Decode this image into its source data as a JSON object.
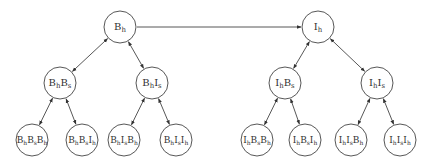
{
  "diagram": {
    "type": "tree",
    "colors": {
      "stroke": "#444444",
      "text": "#333333",
      "background": "#ffffff"
    },
    "nodes": [
      {
        "id": "Bh",
        "x": 120,
        "y": 27,
        "r": 16,
        "parts": [
          [
            "B",
            "h"
          ]
        ]
      },
      {
        "id": "Ih",
        "x": 318,
        "y": 27,
        "r": 16,
        "parts": [
          [
            "I",
            "h"
          ]
        ]
      },
      {
        "id": "BhBs",
        "x": 60,
        "y": 83,
        "r": 16,
        "parts": [
          [
            "B",
            "h"
          ],
          [
            "B",
            "s"
          ]
        ]
      },
      {
        "id": "BhIs",
        "x": 152,
        "y": 83,
        "r": 16,
        "parts": [
          [
            "B",
            "h"
          ],
          [
            "I",
            "s"
          ]
        ]
      },
      {
        "id": "IhBs",
        "x": 285,
        "y": 83,
        "r": 16,
        "parts": [
          [
            "I",
            "h"
          ],
          [
            "B",
            "s"
          ]
        ]
      },
      {
        "id": "IhIs",
        "x": 377,
        "y": 83,
        "r": 16,
        "parts": [
          [
            "I",
            "h"
          ],
          [
            "I",
            "s"
          ]
        ]
      },
      {
        "id": "BhBsBh",
        "x": 32,
        "y": 140,
        "r": 16,
        "parts": [
          [
            "B",
            "h"
          ],
          [
            "B",
            "s"
          ],
          [
            "B",
            "h"
          ]
        ]
      },
      {
        "id": "BhBsIh",
        "x": 82,
        "y": 140,
        "r": 16,
        "parts": [
          [
            "B",
            "h"
          ],
          [
            "B",
            "s"
          ],
          [
            "I",
            "h"
          ]
        ]
      },
      {
        "id": "BhIsBh",
        "x": 124,
        "y": 140,
        "r": 16,
        "parts": [
          [
            "B",
            "h"
          ],
          [
            "I",
            "s"
          ],
          [
            "B",
            "h"
          ]
        ]
      },
      {
        "id": "BhIsIh",
        "x": 176,
        "y": 140,
        "r": 16,
        "parts": [
          [
            "B",
            "h"
          ],
          [
            "I",
            "s"
          ],
          [
            "I",
            "h"
          ]
        ]
      },
      {
        "id": "IhBsBh",
        "x": 257,
        "y": 140,
        "r": 16,
        "parts": [
          [
            "I",
            "h"
          ],
          [
            "B",
            "s"
          ],
          [
            "B",
            "h"
          ]
        ]
      },
      {
        "id": "IhBsIh",
        "x": 305,
        "y": 140,
        "r": 16,
        "parts": [
          [
            "I",
            "h"
          ],
          [
            "B",
            "s"
          ],
          [
            "I",
            "h"
          ]
        ]
      },
      {
        "id": "IhIsBh",
        "x": 351,
        "y": 140,
        "r": 16,
        "parts": [
          [
            "I",
            "h"
          ],
          [
            "I",
            "s"
          ],
          [
            "B",
            "h"
          ]
        ]
      },
      {
        "id": "IhIsIh",
        "x": 400,
        "y": 140,
        "r": 16,
        "parts": [
          [
            "I",
            "h"
          ],
          [
            "I",
            "s"
          ],
          [
            "I",
            "h"
          ]
        ]
      }
    ],
    "edges": [
      {
        "from": "Bh",
        "to": "Ih",
        "direction": "forward"
      },
      {
        "from": "Bh",
        "to": "BhBs",
        "direction": "both"
      },
      {
        "from": "Bh",
        "to": "BhIs",
        "direction": "both"
      },
      {
        "from": "Ih",
        "to": "IhBs",
        "direction": "both"
      },
      {
        "from": "Ih",
        "to": "IhIs",
        "direction": "both"
      },
      {
        "from": "BhBs",
        "to": "BhBsBh",
        "direction": "both"
      },
      {
        "from": "BhBs",
        "to": "BhBsIh",
        "direction": "both"
      },
      {
        "from": "BhIs",
        "to": "BhIsBh",
        "direction": "both"
      },
      {
        "from": "BhIs",
        "to": "BhIsIh",
        "direction": "both"
      },
      {
        "from": "IhBs",
        "to": "IhBsBh",
        "direction": "both"
      },
      {
        "from": "IhBs",
        "to": "IhBsIh",
        "direction": "both"
      },
      {
        "from": "IhIs",
        "to": "IhIsBh",
        "direction": "both"
      },
      {
        "from": "IhIs",
        "to": "IhIsIh",
        "direction": "both"
      }
    ]
  }
}
